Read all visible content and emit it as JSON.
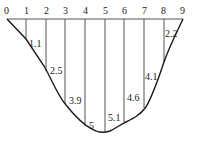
{
  "diagram": {
    "stations": [
      "0",
      "1",
      "2",
      "3",
      "4",
      "5",
      "6",
      "7",
      "8",
      "9"
    ],
    "depths": [
      {
        "station": "1",
        "value": "1.1"
      },
      {
        "station": "2",
        "value": "2.5"
      },
      {
        "station": "3",
        "value": "3.9"
      },
      {
        "station": "4",
        "value": "5"
      },
      {
        "station": "5",
        "value": "5.1"
      },
      {
        "station": "6",
        "value": "4.6"
      },
      {
        "station": "7",
        "value": "4.1"
      },
      {
        "station": "8",
        "value": "2.2"
      }
    ],
    "line_color": "#1a1a1a"
  }
}
